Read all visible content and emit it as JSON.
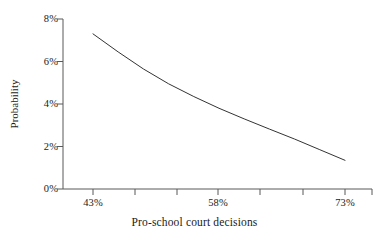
{
  "chart_data": {
    "type": "line",
    "title": "",
    "xlabel": "Pro-school court decisions",
    "ylabel": "Probability",
    "xtick_labels": [
      "43%",
      "58%",
      "73%"
    ],
    "ytick_labels": [
      "0%",
      "2%",
      "4%",
      "6%",
      "8%"
    ],
    "xlim": [
      43,
      73
    ],
    "ylim": [
      0,
      8
    ],
    "grid": false,
    "legend": null,
    "x": [
      43,
      46,
      49,
      52,
      55,
      58,
      61,
      64,
      67,
      70,
      73
    ],
    "y": [
      7.3,
      6.45,
      5.65,
      4.95,
      4.35,
      3.8,
      3.3,
      2.82,
      2.35,
      1.85,
      1.35
    ],
    "series": [
      {
        "name": "Probability",
        "x": [
          43,
          46,
          49,
          52,
          55,
          58,
          61,
          64,
          67,
          70,
          73
        ],
        "values": [
          7.3,
          6.45,
          5.65,
          4.95,
          4.35,
          3.8,
          3.3,
          2.82,
          2.35,
          1.85,
          1.35
        ]
      }
    ],
    "line_color": "#333333",
    "axis_color": "#595959",
    "background_color": "#ffffff"
  },
  "axes": {
    "y_ticks": [
      {
        "label": "8%",
        "value": 8
      },
      {
        "label": "6%",
        "value": 6
      },
      {
        "label": "4%",
        "value": 4
      },
      {
        "label": "2%",
        "value": 2
      },
      {
        "label": "0%",
        "value": 0
      }
    ],
    "x_ticks": [
      {
        "label": "43%",
        "value": 43
      },
      {
        "label": "58%",
        "value": 58
      },
      {
        "label": "73%",
        "value": 73
      }
    ],
    "x_title": "Pro-school court decisions",
    "y_title": "Probability"
  }
}
